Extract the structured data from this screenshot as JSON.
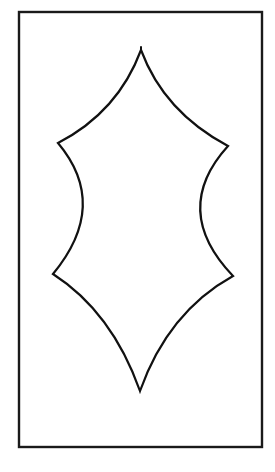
{
  "figure": {
    "frame": {
      "x": 19,
      "y": 12,
      "width": 243,
      "height": 435,
      "stroke": "#1a1a1a"
    },
    "leaf": {
      "outline_color": "#111111",
      "fill_color": "#ffffff",
      "points": {
        "top_tip": [
          141,
          50
        ],
        "upper_left": [
          58,
          143
        ],
        "upper_right": [
          228,
          146
        ],
        "lower_left": [
          53,
          274
        ],
        "lower_right": [
          233,
          276
        ],
        "bottom_tip": [
          140,
          391
        ]
      }
    }
  }
}
